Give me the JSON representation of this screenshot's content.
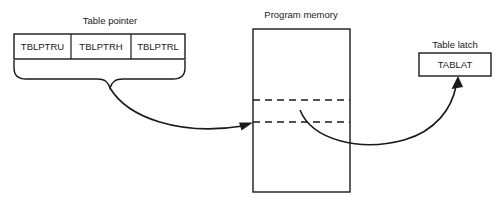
{
  "diagram": {
    "background_color": "#ffffff",
    "line_color": "#1a1a1a",
    "table_pointer": {
      "label": "Table pointer",
      "registers": [
        {
          "name": "TBLPTRU"
        },
        {
          "name": "TBLPTRH"
        },
        {
          "name": "TBLPTRL"
        }
      ],
      "brace": "curly-brace-under-registers"
    },
    "program_memory": {
      "label": "Program memory",
      "dashed_rows": 2
    },
    "table_latch": {
      "label": "Table latch",
      "register": "TABLAT"
    },
    "connectors": [
      {
        "name": "pointer-to-memory-arrow",
        "from": "table-pointer-brace",
        "to": "program-memory-row"
      },
      {
        "name": "memory-to-latch-arrow",
        "from": "program-memory-row",
        "to": "table-latch"
      }
    ]
  }
}
